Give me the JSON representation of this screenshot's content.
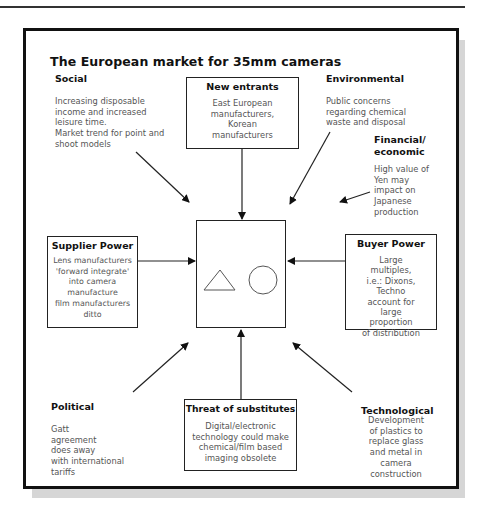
{
  "diagram": {
    "title": "The European market for 35mm cameras",
    "type": "forces-diagram",
    "center": {
      "label": "",
      "shapes": [
        "triangle-icon",
        "circle-icon"
      ]
    },
    "factors": {
      "social": {
        "heading": "Social",
        "text_lines": [
          "Increasing disposable",
          "income and increased",
          "leisure time.",
          "Market trend for point and",
          "shoot models"
        ]
      },
      "new_entrants": {
        "heading": "New entrants",
        "text_lines": [
          "East European",
          "manufacturers,",
          "Korean",
          "manufacturers"
        ]
      },
      "environmental": {
        "heading": "Environmental",
        "text_lines": [
          "Public concerns",
          "regarding chemical",
          "waste and disposal"
        ]
      },
      "financial": {
        "heading_lines": [
          "Financial/",
          "economic"
        ],
        "text_lines": [
          "High value of",
          "Yen may",
          "impact on",
          "Japanese",
          "production"
        ]
      },
      "supplier_power": {
        "heading": "Supplier Power",
        "text_lines": [
          "Lens manufacturers",
          "'forward integrate'",
          "into camera",
          "manufacture",
          "film manufacturers",
          "ditto"
        ]
      },
      "buyer_power": {
        "heading": "Buyer Power",
        "text_lines": [
          "Large",
          "multiples,",
          "i.e.: Dixons,",
          "Techno",
          "account for",
          "large",
          "proportion",
          "of distribution"
        ]
      },
      "political": {
        "heading": "Political",
        "text_lines": [
          "Gatt",
          "agreement",
          "does away",
          "with international",
          "tariffs"
        ]
      },
      "substitutes": {
        "heading": "Threat of substitutes",
        "text_lines": [
          "Digital/electronic",
          "technology could make",
          "chemical/film based",
          "imaging obsolete"
        ]
      },
      "technological": {
        "heading": "Technological",
        "text_lines": [
          "Development",
          "of plastics to",
          "replace glass",
          "and metal in",
          "camera",
          "construction"
        ]
      }
    },
    "colors": {
      "frame": "#111111",
      "shadow": "#d6d6d6",
      "text": "#555555",
      "heading": "#111111"
    }
  }
}
